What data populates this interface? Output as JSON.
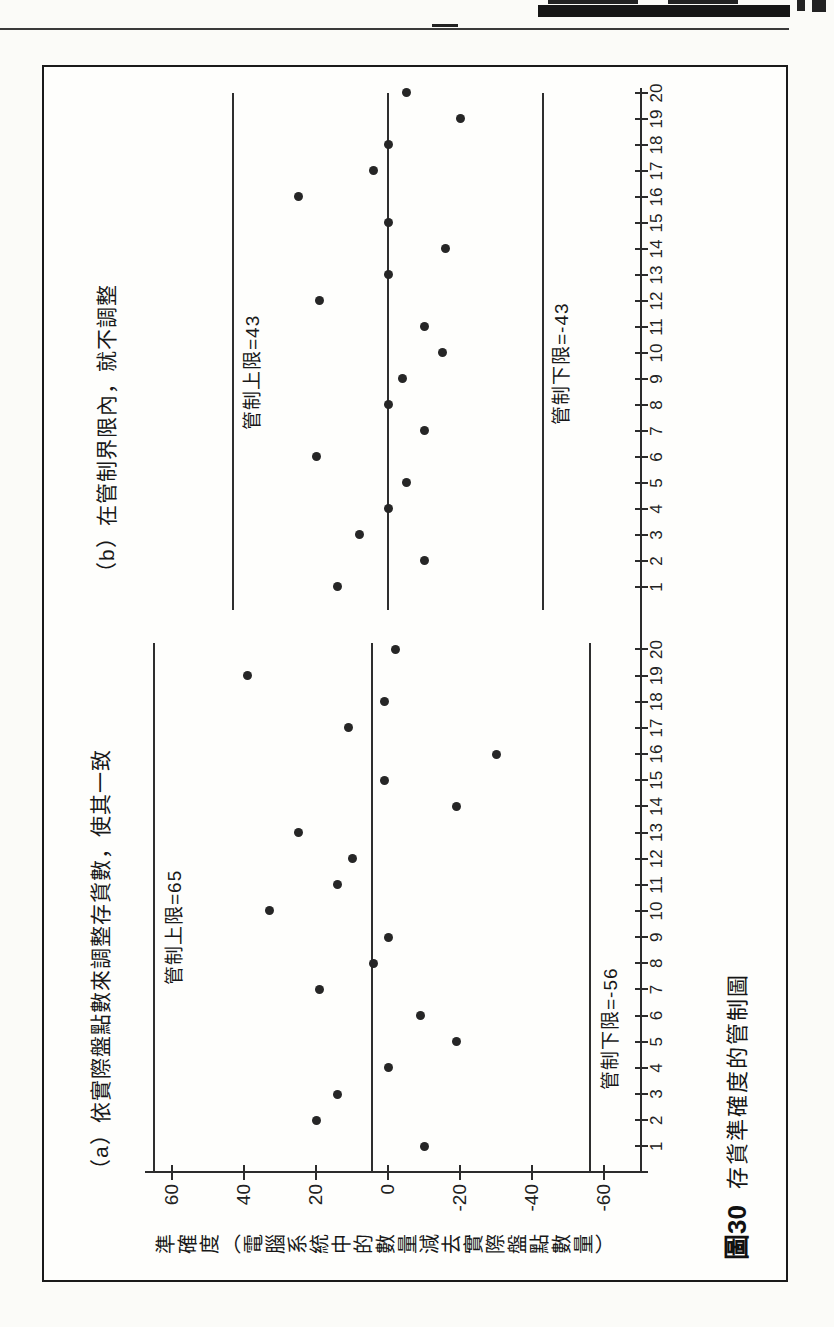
{
  "page": {
    "header_note_fragments": "partially cropped chapter header text",
    "ink_color": "#1c1c1c",
    "paper_color": "#fbfbf8"
  },
  "figure": {
    "caption_label": "圖30",
    "caption_text": "存貨準確度的管制圖"
  },
  "chart_data": {
    "type": "scatter",
    "title": "圖30 存貨準確度的管制圖",
    "xlabel": "",
    "ylabel": "準確度（電腦系統中的數量減去實際盤點數量）",
    "yticks": [
      60,
      40,
      20,
      0,
      -20,
      -40,
      -60
    ],
    "ylim": [
      -72,
      68
    ],
    "x_range": [
      1,
      20
    ],
    "grid": "off",
    "legend": "none",
    "layout_note": "two control-chart panels printed side by side, figure rotated 90 degrees on the book page",
    "panels": [
      {
        "id": "a",
        "title": "（a）依實際盤點數來調整存貨數，使其一致",
        "ucl": 65,
        "lcl": -56,
        "center": 4.5,
        "ucl_label": "管制上限=65",
        "lcl_label": "管制下限=-56",
        "x": [
          1,
          2,
          3,
          4,
          5,
          6,
          7,
          8,
          9,
          10,
          11,
          12,
          13,
          14,
          15,
          16,
          17,
          18,
          19,
          20
        ],
        "values": [
          -10,
          20,
          14,
          0,
          -19,
          -9,
          19,
          4,
          0,
          33,
          14,
          10,
          25,
          -19,
          1,
          -30,
          11,
          1,
          39,
          -2
        ]
      },
      {
        "id": "b",
        "title": "（b）在管制界限內，就不調整",
        "ucl": 43,
        "lcl": -43,
        "center": 0,
        "ucl_label": "管制上限=43",
        "lcl_label": "管制下限=-43",
        "x": [
          1,
          2,
          3,
          4,
          5,
          6,
          7,
          8,
          9,
          10,
          11,
          12,
          13,
          14,
          15,
          16,
          17,
          18,
          19,
          20
        ],
        "values": [
          14,
          -10,
          8,
          0,
          -5,
          20,
          -10,
          0,
          -4,
          -15,
          -10,
          19,
          0,
          -16,
          0,
          25,
          4,
          0,
          -20,
          -5
        ]
      }
    ]
  }
}
